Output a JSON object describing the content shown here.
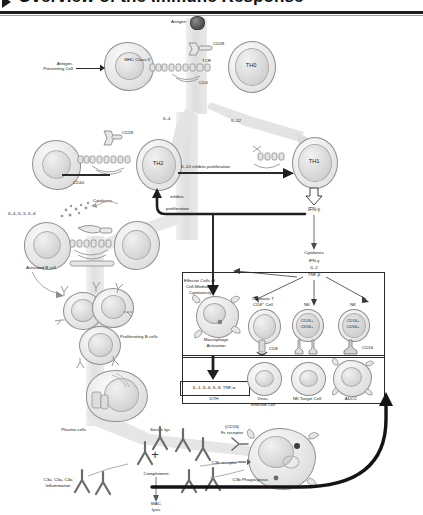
{
  "header": {
    "title": "Overview of the Immune Response",
    "bullet_icon": "triangle-right-icon"
  },
  "diagram": {
    "type": "immunology-flow-diagram",
    "top_section": {
      "antigen": "Antigen",
      "apc": "Antigen-\nPresenting Cell",
      "apc_line1": "Antigen-",
      "apc_line2": "Presenting Cell",
      "mhc": "MHC Class II",
      "cd28": "CD28",
      "tcr": "TCR",
      "cd4": "CD4",
      "th0": "TH0"
    },
    "th_section": {
      "il4": "IL-4",
      "il12": "IL-12",
      "th2": "TH2",
      "th1": "TH1",
      "cd28": "CD28",
      "cd40": "CD40",
      "il10_arrow": "IL-10 inhibits proliferation",
      "inhibits": "inhibits",
      "proliferation": "proliferation",
      "ifn_gamma": "IFN-γ"
    },
    "b_cell_section": {
      "interleukins": "IL-4, IL-5, IL-6",
      "cytokines": "Cytokines",
      "activated_b_cell": "Activated B cell",
      "proliferating_b_cells": "Proliferating B cells",
      "plasma_cells": "Plasma cells"
    },
    "cytokine_cascade": {
      "title": "Cytokines",
      "items": [
        "IFN-γ",
        "IL-2",
        "TNF-β"
      ]
    },
    "effector_section": {
      "effector_label_l1": "Effector Cells of",
      "effector_label_l2": "Cell-Mediated",
      "effector_label_l3": "Cytotoxicity",
      "macrophage_l1": "Macrophage",
      "macrophage_l2": "Activation",
      "dth_box": "IL-1, IL-6, IL-8, TNF-α",
      "dth_label": "DTH",
      "ctl_l1": "Cytotoxic T",
      "ctl_l2": "CD8⁺ Cell",
      "cd8": "CD8",
      "nk_1": "NK",
      "nk_2": "NK",
      "nk_marker_l1": "CD16+",
      "nk_marker_l2": "CD56+",
      "cd16": "CD16"
    },
    "target_section": {
      "target_cells": "Target Cells",
      "virus_l1": "Virus-",
      "virus_l2": "Infected Cell",
      "nk_target": "NK Target Cell",
      "adcc": "ADCC"
    },
    "humoral_section": {
      "serum_igs": "Serum Igs",
      "plus": "+",
      "complement": "Complement",
      "anaphylatoxins_l1": "C3a, C5a, C4a",
      "anaphylatoxins_l2": "Inflammation",
      "mac_l1": "MAC",
      "mac_l2": "lysis",
      "fc_receptor_l1": "(CD16)",
      "fc_receptor_l2": "Fc receptor",
      "c3b_receptor": "C3b receptor",
      "c3b_phagocytosis": "C3b Phagocytosis"
    }
  },
  "colors": {
    "ink": "#1d1d1d",
    "membrane": "#8d8d8d",
    "flow_gray": "#e2e2e2",
    "antigen_dark": "#5a5a5a"
  }
}
